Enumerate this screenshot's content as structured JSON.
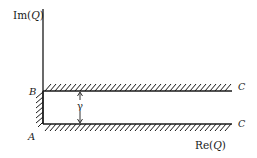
{
  "diagram": {
    "type": "complex-plane-strip",
    "axes": {
      "vertical_label_prefix": "Im(",
      "vertical_label_var": "Q",
      "vertical_label_suffix": ")",
      "horizontal_label_prefix": "Re(",
      "horizontal_label_var": "Q",
      "horizontal_label_suffix": ")"
    },
    "points": {
      "A": "A",
      "B": "B",
      "C_top": "C",
      "C_bottom": "C"
    },
    "width_label": "γ",
    "colors": {
      "ink": "#1a1a1a",
      "background": "#ffffff"
    }
  }
}
